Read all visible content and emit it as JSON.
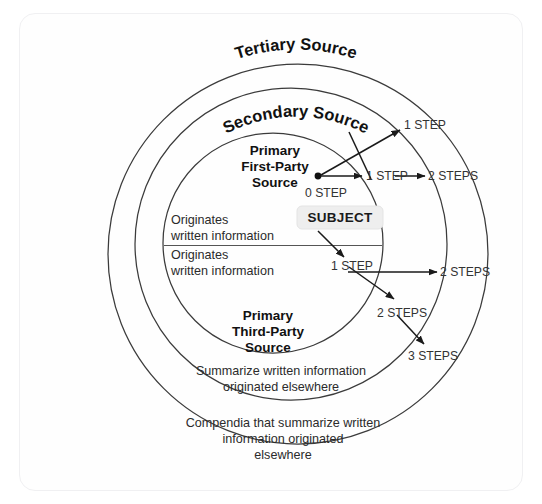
{
  "diagram": {
    "rings": [
      {
        "id": "tertiary",
        "label": "Tertiary Source",
        "description": "Compendia that summarize written information originated elsewhere"
      },
      {
        "id": "secondary",
        "label": "Secondary Source",
        "description": "Summarize written information originated elsewhere"
      },
      {
        "id": "primary",
        "label": "Primary Source",
        "description": "Originates written information"
      }
    ],
    "core": {
      "first_party": {
        "line1": "Primary",
        "line2": "First-Party",
        "line3": "Source",
        "description_line1": "Originates",
        "description_line2": "written information"
      },
      "third_party": {
        "line1": "Primary",
        "line2": "Third-Party",
        "line3": "Source",
        "description_line1": "Originates",
        "description_line2": "written information"
      }
    },
    "secondary_description": {
      "line1": "Summarize written information",
      "line2": "originated elsewhere"
    },
    "tertiary_description": {
      "line1": "Compendia that summarize written",
      "line2": "information originated",
      "line3": "elsewhere"
    },
    "subject": {
      "label": "SUBJECT"
    },
    "steps": {
      "origin": "0 STEP",
      "top_diagonal": "1 STEP",
      "top_horizontal": "1 STEP",
      "top_two": "2 STEPS",
      "mid_one": "1 STEP",
      "mid_two": "2 STEPS",
      "lower_two": "2 STEPS",
      "lower_three": "3 STEPS"
    },
    "colors": {
      "stroke": "#3b3b3b",
      "arrow": "#1a1a1a",
      "text": "#111111",
      "badge_bg": "#eeeeee",
      "background": "#ffffff"
    }
  }
}
